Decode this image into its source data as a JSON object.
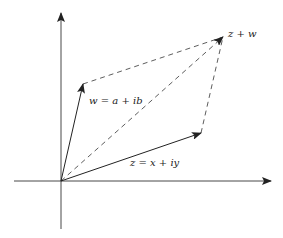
{
  "diagram": {
    "axes": {
      "horizontal": "real-axis",
      "vertical": "imaginary-axis"
    },
    "vectors": [
      {
        "id": "z",
        "label": "z = x + iy",
        "tip": "z"
      },
      {
        "id": "w",
        "label": "w = a + ib",
        "tip": "w"
      },
      {
        "id": "sum",
        "label": "z + w",
        "tip": "z+w"
      }
    ],
    "labels": {
      "z": "z = x + iy",
      "w": "w = a + ib",
      "sum": "z + w"
    },
    "colors": {
      "stroke": "#222222",
      "background": "#ffffff"
    }
  }
}
